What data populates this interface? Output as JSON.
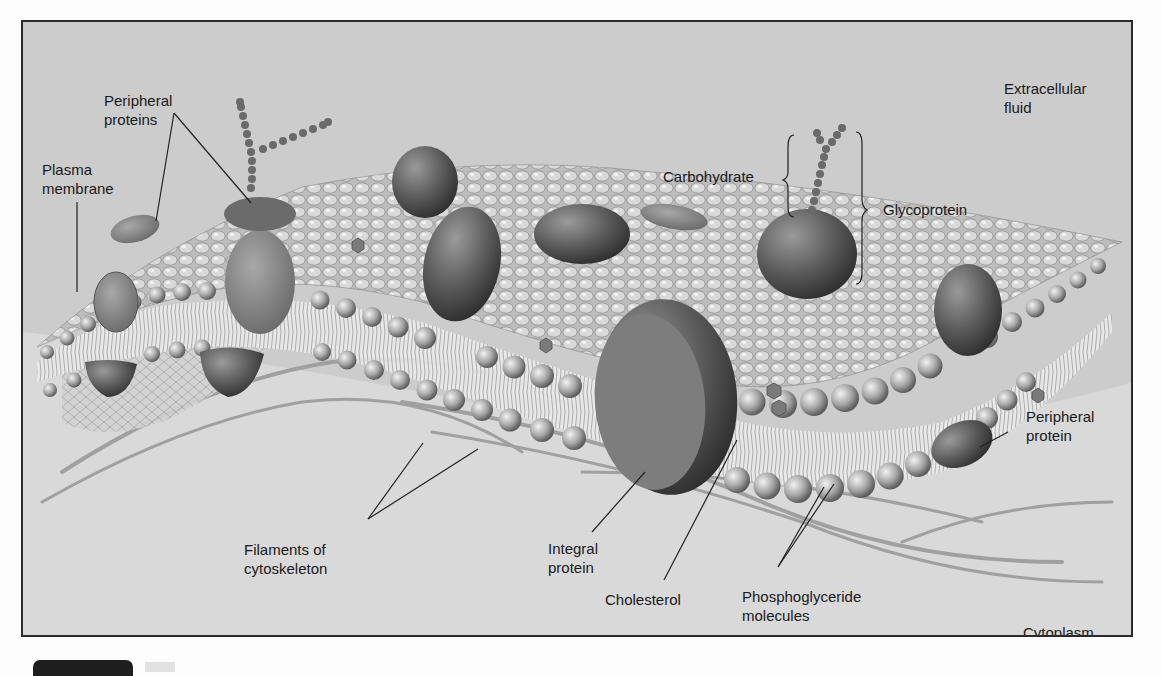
{
  "figure": {
    "colors": {
      "background_extracellular": "#cdcdcd",
      "background_cytoplasm": "#dcdcdc",
      "membrane_heads": "#a9a9a9",
      "protein_dark": "#5a5a5a",
      "protein_mid": "#8a8a8a",
      "frame_border": "#2b2b2b",
      "label_text": "#1a1a1a"
    },
    "regions": {
      "extracellular": "Extracellular\nfluid",
      "cytoplasm": "Cytoplasm"
    },
    "labels": [
      {
        "id": "peripheral-proteins",
        "text": "Peripheral\nproteins"
      },
      {
        "id": "plasma-membrane",
        "text": "Plasma\nmembrane"
      },
      {
        "id": "carbohydrate",
        "text": "Carbohydrate"
      },
      {
        "id": "glycoprotein",
        "text": "Glycoprotein"
      },
      {
        "id": "filaments-of-cytoskeleton",
        "text": "Filaments of\ncytoskeleton"
      },
      {
        "id": "integral-protein",
        "text": "Integral\nprotein"
      },
      {
        "id": "cholesterol",
        "text": "Cholesterol"
      },
      {
        "id": "phosphoglyceride-molecules",
        "text": "Phosphoglyceride\nmolecules"
      },
      {
        "id": "peripheral-protein",
        "text": "Peripheral\nprotein"
      }
    ]
  }
}
